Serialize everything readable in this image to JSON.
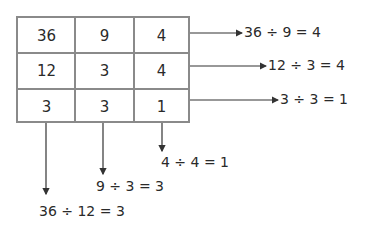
{
  "grid": {
    "rows": [
      [
        "36",
        "9",
        "4"
      ],
      [
        "12",
        "3",
        "4"
      ],
      [
        "3",
        "3",
        "1"
      ]
    ]
  },
  "row_equations": [
    "36 ÷ 9 = 4",
    "12 ÷ 3 = 4",
    "3 ÷ 3 = 1"
  ],
  "column_equations": [
    "36 ÷ 12 = 3",
    "9 ÷ 3 = 3",
    "4 ÷ 4 = 1"
  ],
  "colors": {
    "grid_line": "#8a8a8a",
    "arrow": "#333333",
    "text": "#2a2a2a"
  }
}
